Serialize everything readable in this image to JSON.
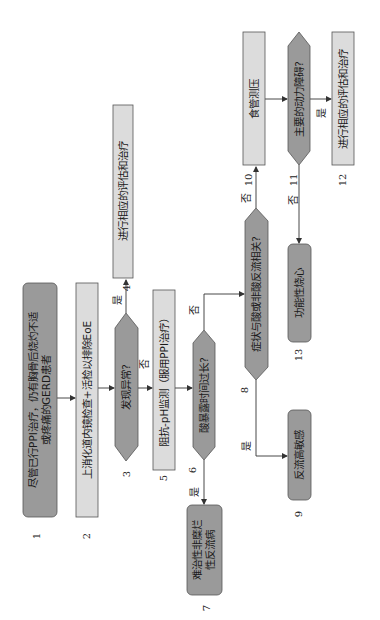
{
  "flowchart": {
    "orientation": "rotated-90-ccw",
    "nodes": [
      {
        "id": 1,
        "type": "terminal",
        "text_line1": "尽管已行PPI治疗，仍有胸骨后烧灼不适",
        "text_line2": "或疼痛的GERD患者",
        "number": "1"
      },
      {
        "id": 2,
        "type": "process",
        "text": "上消化道内镜检查+活检以排除EoE",
        "number": "2"
      },
      {
        "id": 3,
        "type": "decision",
        "text": "发现异常?",
        "number": "3"
      },
      {
        "id": 4,
        "type": "process",
        "text": "进行相应的评估和治疗",
        "number": "4"
      },
      {
        "id": 5,
        "type": "process",
        "text": "阻抗-pH监测（服用PPI治疗）",
        "number": "5"
      },
      {
        "id": 6,
        "type": "decision",
        "text": "酸暴露时间过长?",
        "number": "6"
      },
      {
        "id": 7,
        "type": "terminal",
        "text_line1": "难治性非糜烂",
        "text_line2": "性反流病",
        "number": "7"
      },
      {
        "id": 8,
        "type": "decision",
        "text": "症状与酸或非酸反流相关?",
        "number": "8"
      },
      {
        "id": 9,
        "type": "terminal",
        "text": "反流高敏感",
        "number": "9"
      },
      {
        "id": 10,
        "type": "process",
        "text": "食管测压",
        "number": "10"
      },
      {
        "id": 11,
        "type": "decision",
        "text": "主要的动力障碍?",
        "number": "11"
      },
      {
        "id": 12,
        "type": "process",
        "text": "进行相应的评估和治疗",
        "number": "12"
      },
      {
        "id": 13,
        "type": "terminal",
        "text": "功能性烧心",
        "number": "13"
      }
    ],
    "edge_labels": {
      "yes": "是",
      "no": "否"
    },
    "colors": {
      "terminal_fill": "#9a9a9a",
      "decision_fill": "#9a9a9a",
      "process_fill": "#dcdcdc",
      "stroke": "#555555"
    }
  }
}
